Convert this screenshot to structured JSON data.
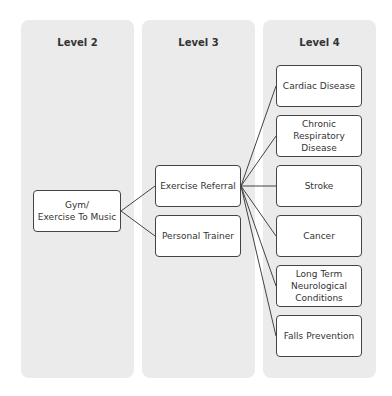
{
  "columns": [
    {
      "title": "Level 2"
    },
    {
      "title": "Level 3"
    },
    {
      "title": "Level 4"
    }
  ],
  "level2": {
    "nodes": [
      {
        "label": "Gym/\nExercise To Music"
      }
    ]
  },
  "level3": {
    "nodes": [
      {
        "label": "Exercise Referral"
      },
      {
        "label": "Personal Trainer"
      }
    ]
  },
  "level4": {
    "nodes": [
      {
        "label": "Cardiac Disease"
      },
      {
        "label": "Chronic\nRespiratory\nDisease"
      },
      {
        "label": "Stroke"
      },
      {
        "label": "Cancer"
      },
      {
        "label": "Long Term\nNeurological\nConditions"
      },
      {
        "label": "Falls Prevention"
      }
    ]
  },
  "edges": [
    {
      "from": "Gym/Exercise To Music",
      "to": "Exercise Referral"
    },
    {
      "from": "Gym/Exercise To Music",
      "to": "Personal Trainer"
    },
    {
      "from": "Exercise Referral",
      "to": "Cardiac Disease"
    },
    {
      "from": "Exercise Referral",
      "to": "Chronic Respiratory Disease"
    },
    {
      "from": "Exercise Referral",
      "to": "Stroke"
    },
    {
      "from": "Exercise Referral",
      "to": "Cancer"
    },
    {
      "from": "Exercise Referral",
      "to": "Long Term Neurological Conditions"
    },
    {
      "from": "Exercise Referral",
      "to": "Falls Prevention"
    }
  ],
  "colors": {
    "column_bg": "#ebebeb",
    "box_bg": "#ffffff",
    "border": "#444444",
    "text": "#333333"
  }
}
